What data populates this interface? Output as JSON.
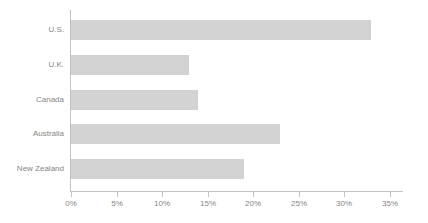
{
  "chart_data": {
    "type": "bar",
    "orientation": "horizontal",
    "title": "",
    "subtitle": "",
    "xlabel": "",
    "ylabel": "",
    "categories": [
      "U.S.",
      "U.K.",
      "Canada",
      "Australia",
      "New Zealand"
    ],
    "values": [
      33,
      13,
      14,
      23,
      19
    ],
    "value_unit": "%",
    "xlim": [
      0,
      35
    ],
    "xtick_values": [
      0,
      5,
      10,
      15,
      20,
      25,
      30,
      35
    ],
    "xtick_labels": [
      "0%",
      "5%",
      "10%",
      "15%",
      "20%",
      "25%",
      "30%",
      "35%"
    ],
    "grid": false,
    "legend": null,
    "annotations": [],
    "colors": {
      "bar_fill": "#d2d2d2",
      "axis_line": "#c3c3c3",
      "tick_label": "#858585",
      "category_label": "#858585",
      "background": "#ffffff"
    }
  }
}
